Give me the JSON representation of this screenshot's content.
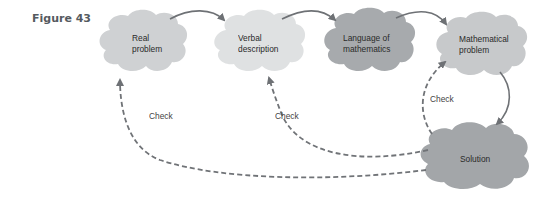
{
  "figure": {
    "label": "Figure 43"
  },
  "nodes": [
    {
      "id": "real",
      "line1": "Real",
      "line2": "problem",
      "color": "#cfd1d3"
    },
    {
      "id": "verbal",
      "line1": "Verbal",
      "line2": "description",
      "color": "#dfe1e2"
    },
    {
      "id": "language",
      "line1": "Language of",
      "line2": "mathematics",
      "color": "#a7aaad"
    },
    {
      "id": "mathproblem",
      "line1": "Mathematical",
      "line2": "problem",
      "color": "#c7c9cb"
    },
    {
      "id": "solution",
      "line1": "Solution",
      "line2": "",
      "color": "#a3a6a9"
    }
  ],
  "edges": [
    {
      "from": "Real problem",
      "to": "Verbal description",
      "style": "solid"
    },
    {
      "from": "Verbal description",
      "to": "Language of mathematics",
      "style": "solid"
    },
    {
      "from": "Language of mathematics",
      "to": "Mathematical problem",
      "style": "solid"
    },
    {
      "from": "Mathematical problem",
      "to": "Solution",
      "style": "solid"
    },
    {
      "from": "Solution",
      "to": "Mathematical problem",
      "style": "dashed",
      "label": "Check"
    },
    {
      "from": "Solution",
      "to": "Verbal description",
      "style": "dashed",
      "label": "Check"
    },
    {
      "from": "Solution",
      "to": "Real problem",
      "style": "dashed",
      "label": "Check"
    }
  ],
  "check_labels": [
    "Check",
    "Check",
    "Check"
  ],
  "colors": {
    "arrow": "#6e7175",
    "dashed": "#707377"
  }
}
